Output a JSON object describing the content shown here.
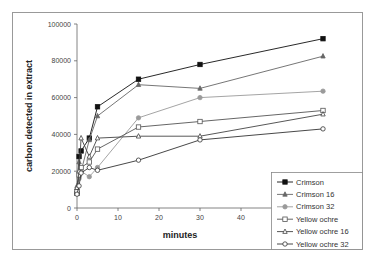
{
  "chart_data": {
    "type": "line",
    "title": "",
    "xlabel": "minutes",
    "ylabel": "carbon detected in extract",
    "xlim": [
      0,
      50
    ],
    "ylim": [
      0,
      100000
    ],
    "x_ticks": [
      "0",
      "10",
      "20",
      "30",
      "40"
    ],
    "y_ticks": [
      "0",
      "20000",
      "40000",
      "60000",
      "80000",
      "100000"
    ],
    "grid": false,
    "legend_position": "lower right",
    "series": [
      {
        "name": "Crimson",
        "marker": "filled-square",
        "color": "#111111",
        "x": [
          0,
          0.5,
          1,
          3,
          5,
          15,
          30,
          60
        ],
        "values": [
          8000,
          28000,
          31000,
          38000,
          55000,
          70000,
          78000,
          92000
        ]
      },
      {
        "name": "Crimson 16",
        "marker": "filled-triangle",
        "color": "#666666",
        "x": [
          0,
          0.5,
          1,
          3,
          5,
          15,
          30,
          60
        ],
        "values": [
          12000,
          25000,
          20000,
          37000,
          50000,
          67000,
          65000,
          82500
        ]
      },
      {
        "name": "Crimson 32",
        "marker": "filled-circle",
        "color": "#9a9a9a",
        "x": [
          0,
          0.5,
          1,
          3,
          5,
          15,
          30,
          60
        ],
        "values": [
          10000,
          16000,
          20000,
          17000,
          22000,
          49000,
          60000,
          63500
        ]
      },
      {
        "name": "Yellow ochre",
        "marker": "open-square",
        "color": "#555555",
        "x": [
          0,
          0.5,
          1,
          3,
          5,
          15,
          30,
          60
        ],
        "values": [
          9000,
          18000,
          22000,
          25000,
          32000,
          44000,
          47000,
          53000
        ]
      },
      {
        "name": "Yellow ochre 16",
        "marker": "open-triangle",
        "color": "#444444",
        "x": [
          0,
          0.5,
          1,
          3,
          5,
          15,
          30,
          60
        ],
        "values": [
          11000,
          20000,
          38000,
          28000,
          38000,
          39000,
          39000,
          51000
        ]
      },
      {
        "name": "Yellow ochre 32",
        "marker": "open-circle",
        "color": "#333333",
        "x": [
          0,
          0.5,
          1,
          3,
          5,
          15,
          30,
          60
        ],
        "values": [
          7500,
          12000,
          19000,
          22000,
          20500,
          26000,
          37000,
          43000
        ]
      }
    ]
  }
}
